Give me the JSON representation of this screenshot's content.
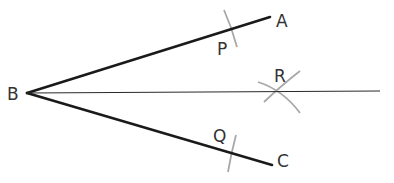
{
  "diagram": {
    "colors": {
      "ray": "#1a1a1a",
      "bisector": "#2a2a2a",
      "arc": "#a8a8a8",
      "label": "#333333",
      "background": "#ffffff"
    },
    "points": {
      "B": {
        "label": "B",
        "x": 27,
        "y": 93
      },
      "A": {
        "label": "A",
        "x": 270,
        "y": 17
      },
      "C": {
        "label": "C",
        "x": 272,
        "y": 165
      },
      "P": {
        "label": "P",
        "x": 231,
        "y": 29
      },
      "Q": {
        "label": "Q",
        "x": 232,
        "y": 152
      },
      "R": {
        "label": "R",
        "x": 279,
        "y": 92
      }
    },
    "segments": [
      {
        "name": "ray-BA",
        "from": "B",
        "to": "A"
      },
      {
        "name": "ray-BC",
        "from": "B",
        "to": "C"
      },
      {
        "name": "bisector-BR",
        "from": "B",
        "to_x": 380,
        "to_y": 91
      }
    ],
    "labels": {
      "B": "B",
      "A": "A",
      "C": "C",
      "P": "P",
      "Q": "Q",
      "R": "R"
    }
  }
}
